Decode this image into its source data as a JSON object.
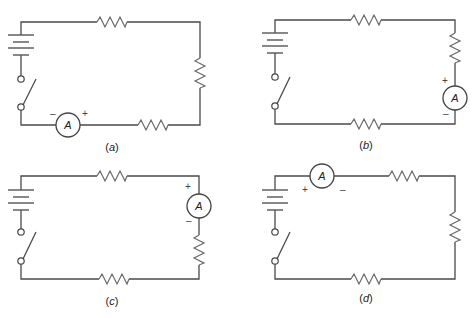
{
  "figure": {
    "colors": {
      "wire": "#4a4a4a",
      "resistor": "#6a6a6a",
      "background": "#ffffff"
    },
    "panels": [
      {
        "id": "a",
        "caption_open": "(",
        "caption_letter": "a",
        "caption_close": ")",
        "meter_label": "A",
        "meter_minus": "–",
        "meter_plus": "+",
        "meter_position": "bottom-left wire"
      },
      {
        "id": "b",
        "caption_open": "(",
        "caption_letter": "b",
        "caption_close": ")",
        "meter_label": "A",
        "meter_minus": "–",
        "meter_plus": "+",
        "meter_position": "right wire below resistor"
      },
      {
        "id": "c",
        "caption_open": "(",
        "caption_letter": "c",
        "caption_close": ")",
        "meter_label": "A",
        "meter_minus": "–",
        "meter_plus": "+",
        "meter_position": "right wire above resistor"
      },
      {
        "id": "d",
        "caption_open": "(",
        "caption_letter": "d",
        "caption_close": ")",
        "meter_label": "A",
        "meter_minus": "–",
        "meter_plus": "+",
        "meter_position": "top-left wire"
      }
    ]
  }
}
